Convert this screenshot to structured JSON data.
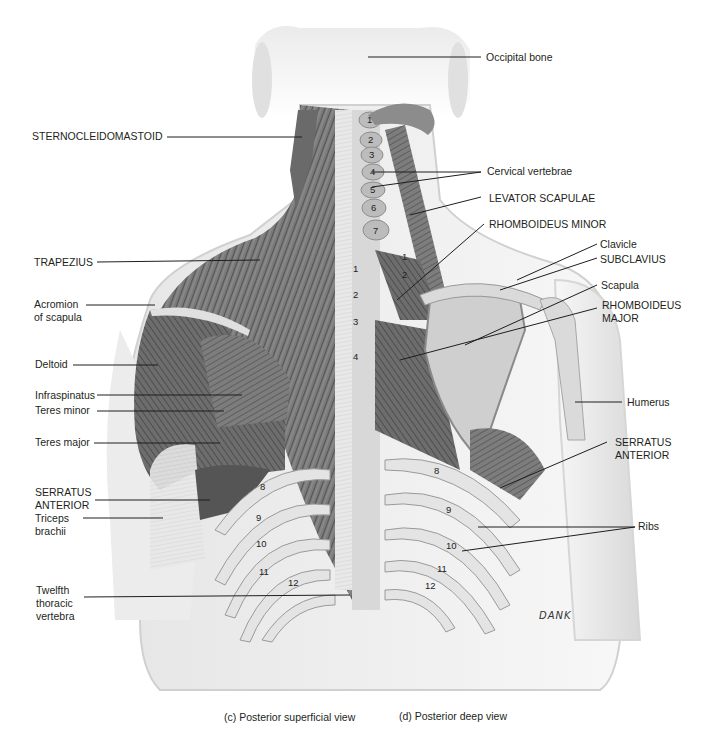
{
  "figure": {
    "left_labels": [
      {
        "id": "sternocleidomastoid",
        "text": "STERNOCLEIDOMASTOID"
      },
      {
        "id": "trapezius",
        "text": "TRAPEZIUS"
      },
      {
        "id": "acromion",
        "text": "Acromion\nof scapula"
      },
      {
        "id": "deltoid",
        "text": "Deltoid"
      },
      {
        "id": "infraspinatus",
        "text": "Infraspinatus"
      },
      {
        "id": "teres-minor",
        "text": "Teres minor"
      },
      {
        "id": "teres-major",
        "text": "Teres major"
      },
      {
        "id": "serratus-anterior-left",
        "text": "SERRATUS\nANTERIOR"
      },
      {
        "id": "triceps",
        "text": "Triceps\nbrachii"
      },
      {
        "id": "twelfth-thoracic",
        "text": "Twelfth\nthoracic\nvertebra"
      }
    ],
    "right_labels": [
      {
        "id": "occipital",
        "text": "Occipital bone"
      },
      {
        "id": "cervical",
        "text": "Cervical vertebrae"
      },
      {
        "id": "levator",
        "text": "LEVATOR SCAPULAE"
      },
      {
        "id": "rhomboid-minor",
        "text": "RHOMBOIDEUS MINOR"
      },
      {
        "id": "clavicle",
        "text": "Clavicle"
      },
      {
        "id": "subclavius",
        "text": "SUBCLAVIUS"
      },
      {
        "id": "scapula",
        "text": "Scapula"
      },
      {
        "id": "rhomboid-major",
        "text": "RHOMBOIDEUS\nMAJOR"
      },
      {
        "id": "humerus",
        "text": "Humerus"
      },
      {
        "id": "serratus-anterior-right",
        "text": "SERRATUS\nANTERIOR"
      },
      {
        "id": "ribs",
        "text": "Ribs"
      }
    ],
    "cervical_numbers": [
      "1",
      "2",
      "3",
      "4",
      "5",
      "6",
      "7"
    ],
    "thoracic_numbers_superficial": [
      "1",
      "2",
      "3",
      "4"
    ],
    "thoracic_numbers_deep": [
      "1",
      "2"
    ],
    "rib_numbers_left": [
      "8",
      "9",
      "10",
      "11",
      "12"
    ],
    "rib_numbers_right": [
      "8",
      "9",
      "10",
      "11",
      "12"
    ],
    "signature": "DANK",
    "captions": {
      "superficial": "(c) Posterior superficial view",
      "deep": "(d) Posterior deep view"
    },
    "colors": {
      "muscle_dark": "#5a5a5a",
      "muscle_mid": "#8a8a8a",
      "bone": "#dcdcdc",
      "skin": "#f0f0f0",
      "line": "#1e1e1e"
    }
  }
}
